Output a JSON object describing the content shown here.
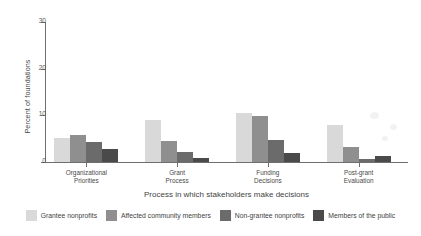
{
  "chart_data": {
    "type": "bar",
    "title": "",
    "subtitle": "",
    "xlabel": "Process in which stakeholders make decisions",
    "ylabel": "Percent of foundations",
    "ylim": [
      0,
      30
    ],
    "yticks": [
      0,
      10,
      20,
      30
    ],
    "ytick_labels": [
      "0",
      "10",
      "20",
      "30"
    ],
    "grid": false,
    "legend_position": "bottom",
    "categories": [
      "Organizational\nPriorities",
      "Grant\nProcess",
      "Funding\nDecisions",
      "Post-grant\nEvaluation"
    ],
    "category_lines": [
      [
        "Organizational",
        "Priorities"
      ],
      [
        "Grant",
        "Process"
      ],
      [
        "Funding",
        "Decisions"
      ],
      [
        "Post-grant",
        "Evaluation"
      ]
    ],
    "series": [
      {
        "name": "Grantee nonprofits",
        "color": "#d9d9d9",
        "values": [
          5.2,
          9.0,
          10.5,
          8.0
        ]
      },
      {
        "name": "Affected community members",
        "color": "#8f8f8f",
        "values": [
          5.8,
          4.5,
          9.8,
          3.3
        ]
      },
      {
        "name": "Non-grantee nonprofits",
        "color": "#6b6b6b",
        "values": [
          4.3,
          2.1,
          4.7,
          0.6
        ]
      },
      {
        "name": "Members of the public",
        "color": "#4a4a4a",
        "values": [
          2.8,
          0.8,
          2.0,
          1.3
        ]
      }
    ]
  },
  "axis": {
    "y_title": "Percent of foundations",
    "x_title": "Process in which stakeholders make decisions",
    "y_tick_0": "0",
    "y_tick_1": "10",
    "y_tick_2": "20",
    "y_tick_3": "30"
  },
  "legend": {
    "items": [
      {
        "label": "Grantee nonprofits",
        "color": "#d9d9d9"
      },
      {
        "label": "Affected community members",
        "color": "#8f8f8f"
      },
      {
        "label": "Non-grantee nonprofits",
        "color": "#6b6b6b"
      },
      {
        "label": "Members of the public",
        "color": "#4a4a4a"
      }
    ]
  }
}
